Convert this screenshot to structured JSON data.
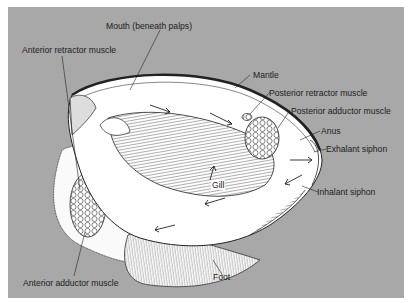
{
  "diagram": {
    "background_color": "#a8a8a8",
    "labels": [
      {
        "id": "mouth",
        "text": "Mouth (beneath palps)"
      },
      {
        "id": "anterior-retractor",
        "text": "Anterior retractor muscle"
      },
      {
        "id": "mantle",
        "text": "Mantle"
      },
      {
        "id": "posterior-retractor",
        "text": "Posterior retractor muscle"
      },
      {
        "id": "posterior-adductor",
        "text": "Posterior adductor muscle"
      },
      {
        "id": "anus",
        "text": "Anus"
      },
      {
        "id": "exhalant-siphon",
        "text": "Exhalant siphon"
      },
      {
        "id": "gill",
        "text": "Gill"
      },
      {
        "id": "inhalant-siphon",
        "text": "Inhalant siphon"
      },
      {
        "id": "foot",
        "text": "Foot"
      },
      {
        "id": "anterior-adductor",
        "text": "Anterior adductor muscle"
      }
    ]
  }
}
